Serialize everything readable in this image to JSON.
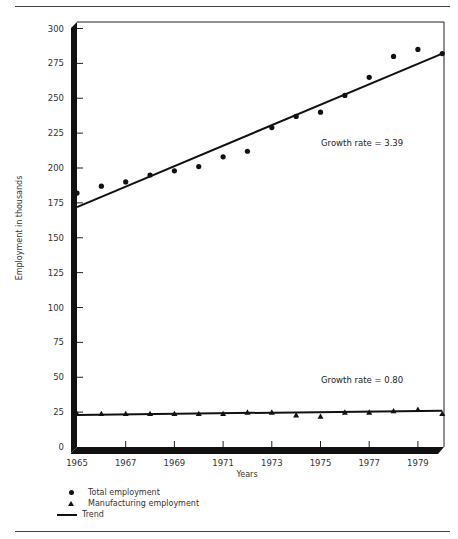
{
  "chart_data": {
    "type": "scatter",
    "title": "",
    "xlabel": "Years",
    "ylabel": "Employment in thousands",
    "xlim": [
      1965,
      1980
    ],
    "ylim": [
      0,
      300
    ],
    "x_ticks": [
      1965,
      1967,
      1969,
      1971,
      1973,
      1975,
      1977,
      1979
    ],
    "y_ticks": [
      0,
      25,
      50,
      75,
      100,
      125,
      150,
      175,
      200,
      225,
      250,
      275,
      300
    ],
    "x": [
      1965,
      1966,
      1967,
      1968,
      1969,
      1970,
      1971,
      1972,
      1973,
      1974,
      1975,
      1976,
      1977,
      1978,
      1979,
      1980
    ],
    "series": [
      {
        "name": "Total employment",
        "marker": "circle",
        "values": [
          182,
          187,
          190,
          195,
          198,
          201,
          208,
          212,
          229,
          237,
          240,
          252,
          265,
          280,
          285,
          282
        ]
      },
      {
        "name": "Manufacturing employment",
        "marker": "triangle",
        "values": [
          24,
          24,
          24,
          24,
          24,
          24,
          24,
          25,
          25,
          23,
          22,
          25,
          25,
          26,
          27,
          24
        ]
      }
    ],
    "trends": [
      {
        "name": "Trend (Total employment)",
        "start": [
          1965,
          172
        ],
        "end": [
          1980,
          282
        ],
        "annotation": "Growth rate = 3.39"
      },
      {
        "name": "Trend (Manufacturing employment)",
        "start": [
          1965,
          23
        ],
        "end": [
          1980,
          26
        ],
        "annotation": "Growth rate = 0.80"
      }
    ],
    "legend": [
      "Total employment",
      "Manufacturing employment",
      "Trend"
    ],
    "legend_position": "bottom-left",
    "grid": false
  },
  "labels": {
    "y_axis_title": "Employment in thousands",
    "x_axis_title": "Years",
    "growth_total": "Growth rate = 3.39",
    "growth_manufacturing": "Growth rate = 0.80",
    "legend_total": "Total employment",
    "legend_manufacturing": "Manufacturing employment",
    "legend_trend": "Trend"
  },
  "colors": {
    "ink": "#111111",
    "text": "#333333",
    "background": "#ffffff"
  }
}
